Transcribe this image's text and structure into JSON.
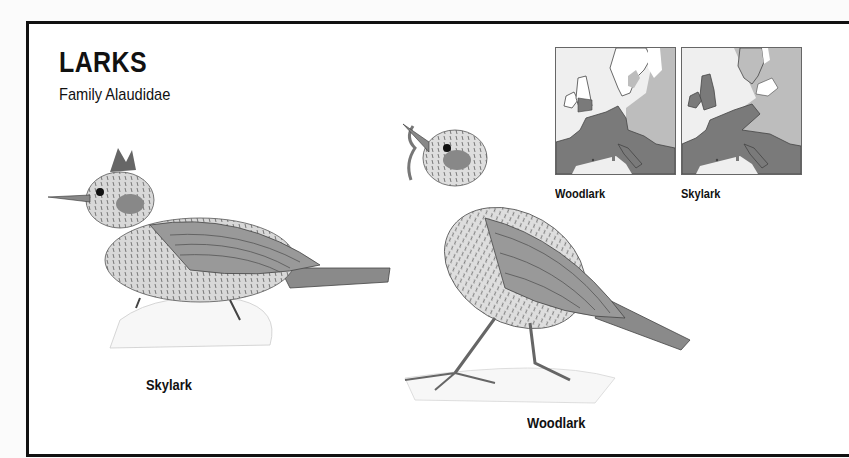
{
  "header": {
    "title": "LARKS",
    "subtitle": "Family Alaudidae"
  },
  "maps": [
    {
      "label": "Woodlark",
      "icon": "europe-range-map"
    },
    {
      "label": "Skylark",
      "icon": "europe-range-map"
    }
  ],
  "illustrations": [
    {
      "label": "Skylark",
      "icon": "skylark-illustration"
    },
    {
      "label": "Woodlark",
      "icon": "woodlark-illustration"
    }
  ],
  "colors": {
    "frame": "#111111",
    "range_dark": "#7a7a7a",
    "range_light": "#bdbdbd",
    "sea": "#efefef",
    "land_unoccupied": "#ffffff"
  }
}
